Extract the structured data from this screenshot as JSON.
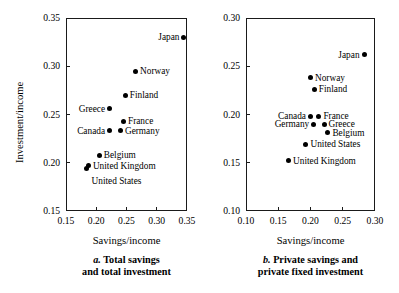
{
  "chart_data": [
    {
      "type": "scatter",
      "panel_id": "a",
      "caption_letter": "a.",
      "caption_line1": "Total savings",
      "caption_line2": "and total investment",
      "xlabel": "Savings/income",
      "ylabel": "Investment/income",
      "xlim": [
        0.15,
        0.35
      ],
      "ylim": [
        0.15,
        0.35
      ],
      "xticks": [
        0.15,
        0.2,
        0.25,
        0.3,
        0.35
      ],
      "xtick_labels": [
        "0.15",
        "0.20",
        "0.25",
        "0.30",
        "0.35"
      ],
      "yticks": [
        0.15,
        0.2,
        0.25,
        0.3,
        0.35
      ],
      "ytick_labels": [
        "0.15",
        "0.20",
        "0.25",
        "0.30",
        "0.35"
      ],
      "grid": false,
      "legend": "none",
      "points": [
        {
          "label": "Japan",
          "x": 0.345,
          "y": 0.33,
          "label_side": "left"
        },
        {
          "label": "Norway",
          "x": 0.265,
          "y": 0.295,
          "label_side": "right"
        },
        {
          "label": "Finland",
          "x": 0.248,
          "y": 0.27,
          "label_side": "right"
        },
        {
          "label": "Greece",
          "x": 0.222,
          "y": 0.256,
          "label_side": "left"
        },
        {
          "label": "France",
          "x": 0.245,
          "y": 0.243,
          "label_side": "right"
        },
        {
          "label": "Germany",
          "x": 0.24,
          "y": 0.233,
          "label_side": "right"
        },
        {
          "label": "Canada",
          "x": 0.222,
          "y": 0.233,
          "label_side": "left"
        },
        {
          "label": "Belgium",
          "x": 0.205,
          "y": 0.208,
          "label_side": "right"
        },
        {
          "label": "United Kingdom",
          "x": 0.187,
          "y": 0.197,
          "label_side": "right"
        },
        {
          "label": "United States",
          "x": 0.184,
          "y": 0.194,
          "label_side": "below"
        }
      ]
    },
    {
      "type": "scatter",
      "panel_id": "b",
      "caption_letter": "b.",
      "caption_line1": "Private savings and",
      "caption_line2": "private fixed investment",
      "xlabel": "Savings/income",
      "ylabel": "",
      "xlim": [
        0.1,
        0.3
      ],
      "ylim": [
        0.1,
        0.3
      ],
      "xticks": [
        0.1,
        0.15,
        0.2,
        0.25,
        0.3
      ],
      "xtick_labels": [
        "0.10",
        "0.15",
        "0.20",
        "0.25",
        "0.30"
      ],
      "yticks": [
        0.1,
        0.15,
        0.2,
        0.25,
        0.3
      ],
      "ytick_labels": [
        "0.10",
        "0.15",
        "0.20",
        "0.25",
        "0.30"
      ],
      "grid": false,
      "legend": "none",
      "points": [
        {
          "label": "Japan",
          "x": 0.283,
          "y": 0.262,
          "label_side": "left"
        },
        {
          "label": "Norway",
          "x": 0.2,
          "y": 0.238,
          "label_side": "right"
        },
        {
          "label": "Finland",
          "x": 0.206,
          "y": 0.226,
          "label_side": "right"
        },
        {
          "label": "Canada",
          "x": 0.2,
          "y": 0.198,
          "label_side": "left"
        },
        {
          "label": "France",
          "x": 0.213,
          "y": 0.198,
          "label_side": "right"
        },
        {
          "label": "Germany",
          "x": 0.205,
          "y": 0.19,
          "label_side": "left"
        },
        {
          "label": "Greece",
          "x": 0.221,
          "y": 0.19,
          "label_side": "right"
        },
        {
          "label": "Belgium",
          "x": 0.227,
          "y": 0.181,
          "label_side": "right"
        },
        {
          "label": "United States",
          "x": 0.193,
          "y": 0.169,
          "label_side": "right"
        },
        {
          "label": "United Kingdom",
          "x": 0.166,
          "y": 0.152,
          "label_side": "right"
        }
      ]
    }
  ]
}
